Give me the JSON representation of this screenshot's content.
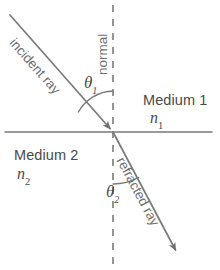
{
  "diagram": {
    "background_color": "#ffffff",
    "line_color": "#7a7a7a",
    "text_color": "#4a4a4a",
    "labels": {
      "incident_ray": "incident ray",
      "refracted_ray": "refracted ray",
      "normal": "normal",
      "medium_1": "Medium 1",
      "medium_2": "Medium 2",
      "index_1": "n",
      "index_1_subscript": "1",
      "index_2": "n",
      "index_2_subscript": "2",
      "theta_1": "θ",
      "theta_1_subscript": "1",
      "theta_2": "θ",
      "theta_2_subscript": "2"
    },
    "geometry": {
      "interface_line": {
        "x1": 5,
        "y1": 132,
        "x2": 212,
        "y2": 132
      },
      "normal_line": {
        "x1": 113,
        "y1": 5,
        "x2": 113,
        "y2": 265,
        "dashed": true
      },
      "incident_ray": {
        "x1": 10,
        "y1": 15,
        "x2": 113,
        "y2": 132,
        "arrow_at": "end"
      },
      "refracted_ray": {
        "x1": 113,
        "y1": 132,
        "x2": 178,
        "y2": 255,
        "arrow_at": "end"
      },
      "incidence_point": {
        "x": 113,
        "y": 132
      },
      "theta_1_arc": {
        "cx": 113,
        "cy": 132,
        "radius": 40
      },
      "theta_2_arc": {
        "cx": 113,
        "cy": 132,
        "radius": 52
      }
    }
  }
}
